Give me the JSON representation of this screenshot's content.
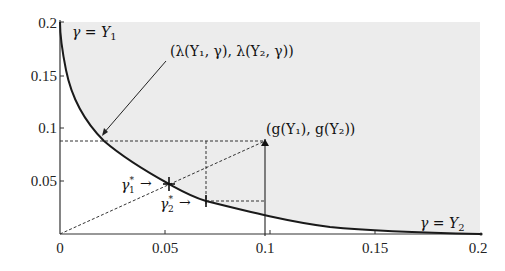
{
  "figure": {
    "type": "diagram",
    "axes": {
      "x_ticks": [
        "0",
        "0.05",
        "0.1",
        "0.15",
        "0.2"
      ],
      "y_ticks": [
        "0.05",
        "0.1",
        "0.15",
        "0.2"
      ],
      "xlim": [
        0,
        0.2
      ],
      "ylim": [
        0,
        0.2
      ]
    },
    "labels": {
      "curve_top": "γ = Y",
      "curve_top_sub": "1",
      "curve_bottom": "γ = Y",
      "curve_bottom_sub": "2",
      "lambda_point": "(λ(Y₁, γ), λ(Y₂, γ))",
      "g_point": "(g(Y₁), g(Y₂))",
      "gamma1_star": "γ",
      "gamma1_sub": "1",
      "gamma2_star": "γ",
      "gamma2_sub": "2",
      "star": "*",
      "arrow": "→"
    },
    "points": {
      "g_point": [
        0.1,
        0.09
      ],
      "lambda_point": [
        0.021,
        0.09
      ],
      "gamma1_star": [
        0.052,
        0.047
      ],
      "gamma2_star": [
        0.0695,
        0.031
      ],
      "origin": [
        0,
        0
      ]
    },
    "colors": {
      "shade": "#ececec",
      "curve": "#1a1a1a",
      "axis": "#333333",
      "dashed": "#333333"
    }
  }
}
